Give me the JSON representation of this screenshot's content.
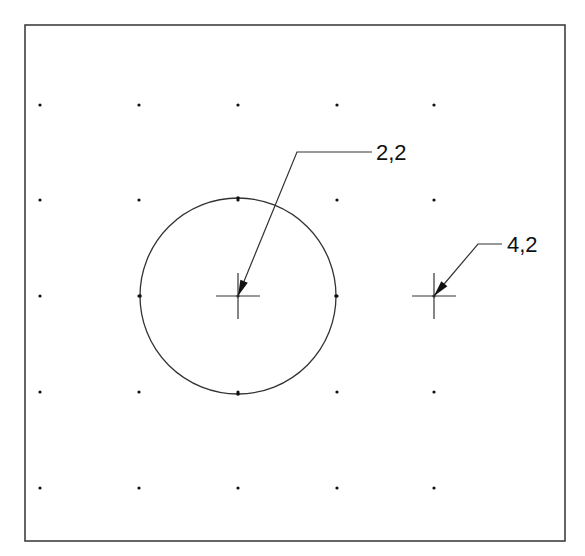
{
  "diagram": {
    "frame": {
      "x": 25,
      "y": 25,
      "width": 540,
      "height": 516
    },
    "grid": {
      "columns_px": [
        40,
        139,
        238,
        337,
        434
      ],
      "rows_px": [
        105,
        200,
        296,
        392,
        488
      ]
    },
    "circle": {
      "cx": 238,
      "cy": 296,
      "r": 98
    },
    "points": [
      {
        "id": "p22",
        "label": "2,2",
        "x": 238,
        "y": 296,
        "leader_from": [
          297,
          152
        ],
        "leader_to": [
          372,
          152
        ],
        "text_x": 376,
        "text_y": 160
      },
      {
        "id": "p42",
        "label": "4,2",
        "x": 434,
        "y": 296,
        "leader_from": [
          478,
          244
        ],
        "leader_to": [
          502,
          244
        ],
        "text_x": 507,
        "text_y": 252
      }
    ],
    "colors": {
      "line": "#333333",
      "dot": "#111111",
      "background": "#ffffff"
    }
  }
}
